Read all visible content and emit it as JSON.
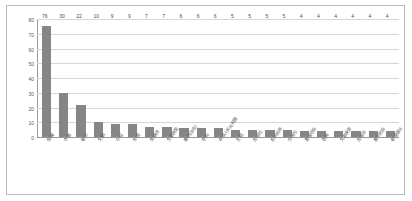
{
  "chart_data": {
    "type": "bar",
    "title": "",
    "xlabel": "",
    "ylabel": "",
    "ylim": [
      0,
      80
    ],
    "yticks": [
      0,
      10,
      20,
      30,
      40,
      50,
      60,
      70,
      80
    ],
    "grid": true,
    "legend": false,
    "bar_color": "#868686",
    "categories": [
      "馆藏",
      "作者",
      "被引",
      "文献",
      "引证",
      "年度",
      "关键词",
      "文献类型",
      "期刊(杂志)",
      "学科",
      "中华人民共和国",
      "主题",
      "出版社",
      "机构名称",
      "分类号",
      "基金项目",
      "语种",
      "文献来源",
      "出版年",
      "期刊栏目",
      "收录情况"
    ],
    "values": [
      76,
      30,
      22,
      10,
      9,
      9,
      7,
      7,
      6,
      6,
      6,
      5,
      5,
      5,
      5,
      4,
      4,
      4,
      4,
      4,
      4
    ]
  }
}
